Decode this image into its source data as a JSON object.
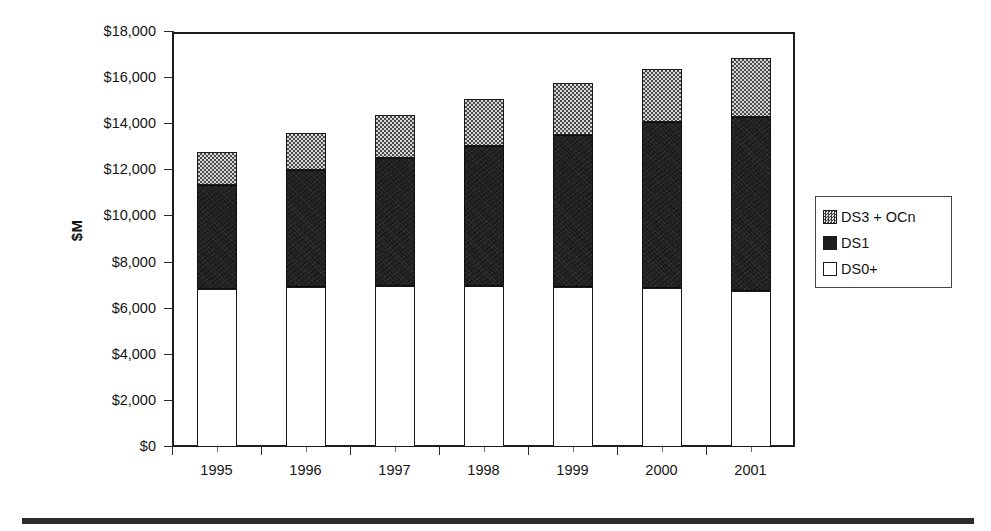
{
  "chart_data": {
    "type": "bar",
    "stacked": true,
    "title": "",
    "xlabel": "",
    "ylabel": "$M",
    "ylim": [
      0,
      18000
    ],
    "ytick_step": 2000,
    "ytick_labels": [
      "$18,000",
      "$16,000",
      "$14,000",
      "$12,000",
      "$10,000",
      "$8,000",
      "$6,000",
      "$4,000",
      "$2,000",
      "$0"
    ],
    "ytick_values": [
      18000,
      16000,
      14000,
      12000,
      10000,
      8000,
      6000,
      4000,
      2000,
      0
    ],
    "categories": [
      "1995",
      "1996",
      "1997",
      "1998",
      "1999",
      "2000",
      "2001"
    ],
    "grid": false,
    "legend_position": "right",
    "series": [
      {
        "name": "DS0+",
        "order": 0,
        "fill": "white",
        "values": [
          6850,
          6950,
          7000,
          7000,
          6950,
          6900,
          6750
        ]
      },
      {
        "name": "DS1",
        "order": 1,
        "fill": "black",
        "values": [
          4500,
          5050,
          5550,
          6050,
          6600,
          7200,
          7550
        ]
      },
      {
        "name": "DS3 + OCn",
        "order": 2,
        "fill": "gray-checker",
        "values": [
          1450,
          1600,
          1850,
          2050,
          2250,
          2300,
          2570
        ]
      }
    ],
    "totals": [
      12800,
      13600,
      14400,
      15100,
      15800,
      16400,
      16870
    ]
  },
  "legend": {
    "items": [
      {
        "label": "DS3 + OCn",
        "swatch": "gray-checker-swatch"
      },
      {
        "label": "DS1",
        "swatch": "black-swatch"
      },
      {
        "label": "DS0+",
        "swatch": "white-swatch"
      }
    ]
  },
  "axis": {
    "y_title": "$M"
  },
  "colors": {
    "ds0_fill": "#ffffff",
    "ds1_fill": "#1c1c1c",
    "ds3_fill": "#9a9a9a",
    "outline": "#1a1a1a",
    "text": "#141414"
  }
}
